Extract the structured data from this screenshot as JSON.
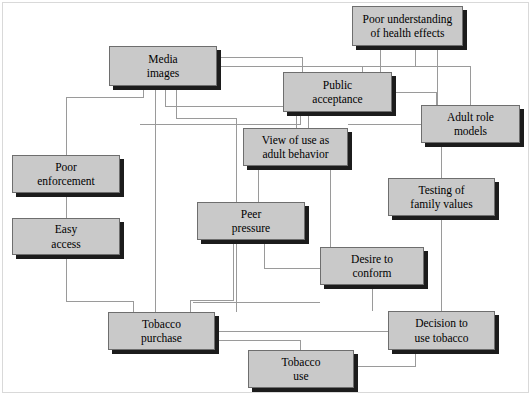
{
  "diagram": {
    "type": "flowchart",
    "canvas": {
      "width": 532,
      "height": 396
    },
    "style": {
      "node_fill": "#c9c9c9",
      "node_border": "#6e6e6e",
      "node_shadow": "#1c1c1c",
      "edge_color": "#9a9a9a",
      "background": "#ffffff",
      "frame_color": "#d9d9d9"
    },
    "nodes": [
      {
        "id": "poor-understanding",
        "line1": "Poor understanding",
        "line2": "of health effects",
        "x": 352,
        "y": 6,
        "w": 111,
        "h": 40
      },
      {
        "id": "media-images",
        "line1": "Media",
        "line2": "images",
        "x": 109,
        "y": 46,
        "w": 108,
        "h": 40
      },
      {
        "id": "public-acceptance",
        "line1": "Public",
        "line2": "acceptance",
        "x": 283,
        "y": 72,
        "w": 109,
        "h": 40
      },
      {
        "id": "adult-role-models",
        "line1": "Adult role",
        "line2": "models",
        "x": 421,
        "y": 105,
        "w": 99,
        "h": 38
      },
      {
        "id": "view-of-use",
        "line1": "View of use as",
        "line2": "adult behavior",
        "x": 243,
        "y": 128,
        "w": 105,
        "h": 38
      },
      {
        "id": "poor-enforcement",
        "line1": "Poor",
        "line2": "enforcement",
        "x": 12,
        "y": 155,
        "w": 108,
        "h": 38
      },
      {
        "id": "testing-family-values",
        "line1": "Testing of",
        "line2": "family values",
        "x": 388,
        "y": 178,
        "w": 107,
        "h": 38
      },
      {
        "id": "peer-pressure",
        "line1": "Peer",
        "line2": "pressure",
        "x": 197,
        "y": 202,
        "w": 108,
        "h": 38
      },
      {
        "id": "easy-access",
        "line1": "Easy",
        "line2": "access",
        "x": 12,
        "y": 218,
        "w": 108,
        "h": 37
      },
      {
        "id": "desire-to-conform",
        "line1": "Desire to",
        "line2": "conform",
        "x": 320,
        "y": 247,
        "w": 104,
        "h": 38
      },
      {
        "id": "tobacco-purchase",
        "line1": "Tobacco",
        "line2": "purchase",
        "x": 108,
        "y": 312,
        "w": 107,
        "h": 38
      },
      {
        "id": "decision-to-use-tobacco",
        "line1": "Decision to",
        "line2": "use tobacco",
        "x": 388,
        "y": 311,
        "w": 107,
        "h": 39
      },
      {
        "id": "tobacco-use",
        "line1": "Tobacco",
        "line2": "use",
        "x": 248,
        "y": 350,
        "w": 106,
        "h": 38
      }
    ],
    "edges": [
      {
        "from": "media-images",
        "to": "public-acceptance",
        "path": "M217,57 L302,57 L302,72"
      },
      {
        "from": "media-images",
        "to": "adult-role-models",
        "path": "M217,66 L470,66 L470,105"
      },
      {
        "from": "poor-understanding",
        "to": "public-acceptance",
        "path": "M380,46 L380,72"
      },
      {
        "from": "poor-understanding",
        "to": "adult-role-models",
        "path": "M437,46 L437,105"
      },
      {
        "from": "poor-understanding",
        "to": "public-acceptance-right",
        "path": "M415,46 L415,66 L362,66 L362,72"
      },
      {
        "from": "media-images",
        "to": "poor-enforcement",
        "path": "M143,86 L143,97 L66,97 L66,155"
      },
      {
        "from": "media-images",
        "to": "view-of-use",
        "path": "M165,86 L165,106 L296,106 L296,128"
      },
      {
        "from": "media-images",
        "to": "peer-pressure",
        "path": "M176,86 L176,118 L236,118 L236,290 L236,312"
      },
      {
        "from": "media-images",
        "to": "tobacco-purchase",
        "path": "M155,86 L155,312"
      },
      {
        "from": "public-acceptance",
        "to": "view-of-use",
        "path": "M308,112 L308,128"
      },
      {
        "from": "public-acceptance",
        "to": "adult-role-models",
        "path": "M392,92 L436,92 L436,105"
      },
      {
        "from": "public-acceptance",
        "to": "peer-pressure-left",
        "path": "M300,112 L300,124 L140,124"
      },
      {
        "from": "adult-role-models",
        "to": "testing-family-values",
        "path": "M441,143 L441,178"
      },
      {
        "from": "adult-role-models",
        "to": "view-of-use-right",
        "path": "M421,124 L348,124"
      },
      {
        "from": "view-of-use",
        "to": "peer-pressure",
        "path": "M258,166 L258,202"
      },
      {
        "from": "view-of-use",
        "to": "desire-to-conform",
        "path": "M330,166 L330,247"
      },
      {
        "from": "testing-family-values",
        "to": "decision-to-use-tobacco",
        "path": "M441,216 L441,311"
      },
      {
        "from": "peer-pressure",
        "to": "tobacco-purchase",
        "path": "M233,240 L233,300 L190,300 L190,312"
      },
      {
        "from": "peer-pressure",
        "to": "desire-to-conform",
        "path": "M264,240 L264,268 L320,268"
      },
      {
        "from": "poor-enforcement",
        "to": "easy-access",
        "path": "M66,193 L66,218"
      },
      {
        "from": "easy-access",
        "to": "tobacco-purchase",
        "path": "M66,255 L66,301 L133,301 L133,312"
      },
      {
        "from": "desire-to-conform",
        "to": "decision-to-use-tobacco",
        "path": "M372,285 L372,311"
      },
      {
        "from": "desire-to-conform-left",
        "to": "tobacco-purchase",
        "path": "M320,302 L193,302"
      },
      {
        "from": "tobacco-purchase",
        "to": "decision-to-use-tobacco",
        "path": "M215,331 L388,331"
      },
      {
        "from": "tobacco-purchase",
        "to": "tobacco-use",
        "path": "M215,340 L300,340 L300,350"
      },
      {
        "from": "decision-to-use-tobacco",
        "to": "tobacco-use",
        "path": "M415,350 L415,366 L354,366"
      }
    ]
  }
}
